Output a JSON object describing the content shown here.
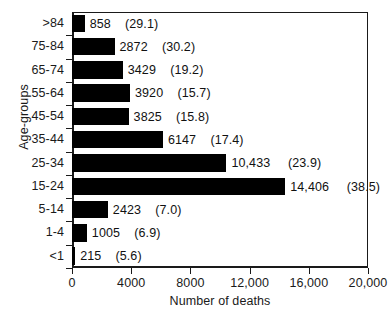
{
  "chart_data": {
    "type": "bar",
    "orientation": "horizontal",
    "title": "",
    "xlabel": "Number of deaths",
    "ylabel": "Age-groups",
    "xlim": [
      0,
      20000
    ],
    "xticks": [
      0,
      4000,
      8000,
      12000,
      16000,
      20000
    ],
    "xticklabels": [
      "0",
      "4000",
      "8000",
      "12,000",
      "16,000",
      "20,000"
    ],
    "grid": false,
    "legend": null,
    "bar_color": "#000000",
    "categories": [
      ">84",
      "75-84",
      "65-74",
      "55-64",
      "45-54",
      "35-44",
      "25-34",
      "15-24",
      "5-14",
      "1-4",
      "<1"
    ],
    "values": [
      858,
      2872,
      3429,
      3920,
      3825,
      6147,
      10433,
      14406,
      2423,
      1005,
      215
    ],
    "value_labels": [
      "858",
      "2872",
      "3429",
      "3920",
      "3825",
      "6147",
      "10,433",
      "14,406",
      "2423",
      "1005",
      "215"
    ],
    "percent_labels": [
      "(29.1)",
      "(30.2)",
      "(19.2)",
      "(15.7)",
      "(15.8)",
      "(17.4)",
      "(23.9)",
      "(38.5)",
      "(7.0)",
      "(6.9)",
      "(5.6)"
    ],
    "percents": [
      29.1,
      30.2,
      19.2,
      15.7,
      15.8,
      17.4,
      23.9,
      38.5,
      7.0,
      6.9,
      5.6
    ],
    "rows": [
      {
        "category": ">84",
        "value": 858,
        "value_label": "858",
        "percent_label": "(29.1)"
      },
      {
        "category": "75-84",
        "value": 2872,
        "value_label": "2872",
        "percent_label": "(30.2)"
      },
      {
        "category": "65-74",
        "value": 3429,
        "value_label": "3429",
        "percent_label": "(19.2)"
      },
      {
        "category": "55-64",
        "value": 3920,
        "value_label": "3920",
        "percent_label": "(15.7)"
      },
      {
        "category": "45-54",
        "value": 3825,
        "value_label": "3825",
        "percent_label": "(15.8)"
      },
      {
        "category": "35-44",
        "value": 6147,
        "value_label": "6147",
        "percent_label": "(17.4)"
      },
      {
        "category": "25-34",
        "value": 10433,
        "value_label": "10,433",
        "percent_label": "(23.9)"
      },
      {
        "category": "15-24",
        "value": 14406,
        "value_label": "14,406",
        "percent_label": "(38.5)"
      },
      {
        "category": "5-14",
        "value": 2423,
        "value_label": "2423",
        "percent_label": "(7.0)"
      },
      {
        "category": "1-4",
        "value": 1005,
        "value_label": "1005",
        "percent_label": "(6.9)"
      },
      {
        "category": "<1",
        "value": 215,
        "value_label": "215",
        "percent_label": "(5.6)"
      }
    ]
  }
}
